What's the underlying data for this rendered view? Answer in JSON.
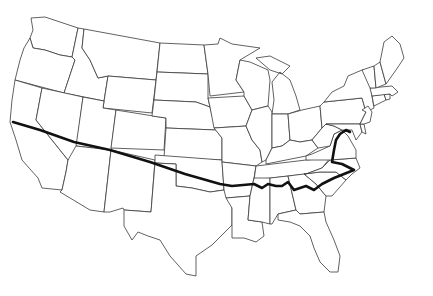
{
  "map": {
    "title": "",
    "region": "Contiguous United States",
    "style": {
      "background": "#ffffff",
      "state_stroke": "#3a3a3a",
      "route_color": "#111111"
    },
    "route": {
      "description": "Thick route line from central California eastward across the southern states to North Carolina coast, then north looping through Virginia",
      "segments": [
        "San Francisco area, California",
        "Nevada / Utah south",
        "Arizona / New Mexico north",
        "Texas panhandle / Oklahoma",
        "Arkansas",
        "Mississippi / Alabama north",
        "Georgia north",
        "South Carolina / North Carolina",
        "North Carolina coast",
        "Virginia loop"
      ]
    }
  }
}
